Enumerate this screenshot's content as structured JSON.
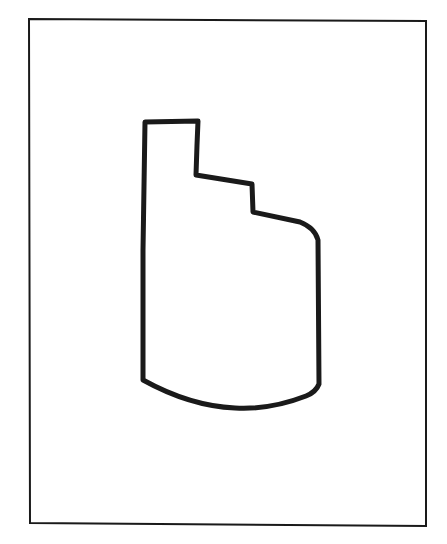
{
  "figure": {
    "width": 447,
    "height": 544,
    "background": "#ffffff",
    "stroke_color": "#1a1a1a",
    "frame": {
      "points": [
        [
          29,
          19
        ],
        [
          426,
          21
        ],
        [
          426,
          526
        ],
        [
          30,
          523
        ]
      ],
      "stroke_width": 2
    },
    "shape": {
      "description": "closed outline with a tall narrow tab at upper-left, two descending steps on the right, a rounded upper-right corner, straight sides and a curved bottom",
      "stroke_width": 5,
      "path": "M145,122 L198,121 L197,145 L196,175 L252,184 L253,212 L300,222 Q315,228 318,240 L319,384 Q316,392 306,396 Q270,410 235,408 Q190,406 143,380 L143,250 Z"
    }
  }
}
